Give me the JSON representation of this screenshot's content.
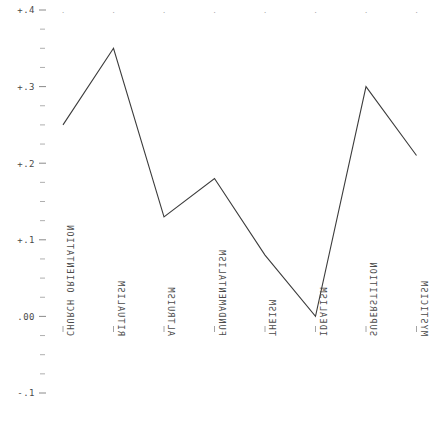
{
  "chart_data": {
    "type": "line",
    "title": "",
    "subtitle": "",
    "xlabel": "",
    "ylabel": "",
    "categories": [
      "CHURCH ORIENTATION",
      "RITUALISM",
      "ALTRUISM",
      "FUNDAMENTALISM",
      "THEISM",
      "IDEALISM",
      "SUPERSTITION",
      "MYSTICISM"
    ],
    "values": [
      0.25,
      0.35,
      0.13,
      0.18,
      0.08,
      0.0,
      0.3,
      0.21
    ],
    "series": [
      {
        "name": "correlation",
        "values": [
          0.25,
          0.35,
          0.13,
          0.18,
          0.08,
          0.0,
          0.3,
          0.21
        ]
      }
    ],
    "ylim": [
      -0.1,
      0.4
    ],
    "xlim": [
      -0.5,
      7.5
    ],
    "ytick_labels": [
      "+.4",
      "+.3",
      "+.2",
      "+.1",
      ".00",
      "-.1"
    ],
    "ytick_values": [
      0.4,
      0.3,
      0.2,
      0.1,
      0.0,
      -0.1
    ],
    "yminor_step": 0.025,
    "grid": false,
    "legend": "none",
    "line_color": "#3c3c3c",
    "tick_color": "#7d7d7d",
    "axis_color": "#8d8d8d",
    "background": "#ffffff",
    "orientation": "x-labels-rotated-90-mirrored"
  },
  "axes": {
    "y_axis_name": "correlation-axis",
    "x_axis_name": "variable-axis"
  }
}
